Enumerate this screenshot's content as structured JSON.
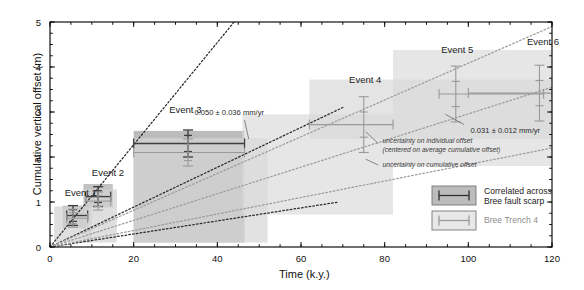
{
  "chart_data": {
    "type": "scatter",
    "title": "",
    "xlabel": "Time (k.y.)",
    "ylabel": "Cumulative vertical offset (m)",
    "xlim": [
      0,
      120
    ],
    "ylim": [
      0,
      5
    ],
    "xticks": [
      0,
      20,
      40,
      60,
      80,
      100,
      120
    ],
    "yticks": [
      0,
      1,
      2,
      3,
      4,
      5
    ],
    "xtick_labels": [
      "0",
      "20",
      "40",
      "60",
      "80",
      "100",
      "120"
    ],
    "ytick_labels": [
      "0",
      "1",
      "2",
      "3",
      "4",
      "5"
    ],
    "xminor_interval": 5,
    "yminor_interval": 0.25,
    "grid": false,
    "legend_position": "lower-right",
    "series": [
      {
        "name": "Correlated across Bree fault scarp",
        "color": "#3f3f3f",
        "points": [
          {
            "label": "Event 1",
            "x": 5.5,
            "y": 0.7,
            "xerr_low": 1.5,
            "xerr_high": 3.5,
            "yerr_cum": 0.22,
            "yerr_ind": 0.13
          },
          {
            "label": "Event 2",
            "x": 11.5,
            "y": 1.12,
            "xerr_low": 3.0,
            "xerr_high": 3.0,
            "yerr_cum": 0.22,
            "yerr_ind": 0.13
          },
          {
            "label": "Event 3",
            "x": 33.0,
            "y": 2.3,
            "xerr_low": 13.0,
            "xerr_high": 13.5,
            "yerr_cum": 0.3,
            "yerr_ind": 0.18
          }
        ]
      },
      {
        "name": "Bree Trench 4",
        "color": "#9a9a9a",
        "points": [
          {
            "label": "Event 1",
            "x": 5.5,
            "y": 0.64,
            "xerr_low": 1.5,
            "xerr_high": 3.5,
            "yerr_cum": 0.2,
            "yerr_ind": 0.12
          },
          {
            "label": "Event 2",
            "x": 11.5,
            "y": 1.02,
            "xerr_low": 3.0,
            "xerr_high": 3.0,
            "yerr_cum": 0.2,
            "yerr_ind": 0.12
          },
          {
            "label": "Event 3",
            "x": 33.0,
            "y": 2.1,
            "xerr_low": 13.0,
            "xerr_high": 13.5,
            "yerr_cum": 0.3,
            "yerr_ind": 0.18
          },
          {
            "label": "Event 4",
            "x": 75.0,
            "y": 2.72,
            "xerr_low": 13.0,
            "xerr_high": 7.0,
            "yerr_cum": 0.62,
            "yerr_ind": 0.28
          },
          {
            "label": "Event 5",
            "x": 97.0,
            "y": 3.4,
            "xerr_low": 4.0,
            "xerr_high": 21.0,
            "yerr_cum": 0.62,
            "yerr_ind": 0.28
          },
          {
            "label": "Event 6",
            "x": 117.0,
            "y": 3.42,
            "xerr_low": 17.0,
            "xerr_high": 3.0,
            "yerr_cum": 0.62,
            "yerr_ind": 0.28
          }
        ]
      }
    ],
    "shaded_boxes": [
      {
        "series": "Correlated across Bree fault scarp",
        "x0": 3.0,
        "x1": 9.0,
        "y0": 0.42,
        "y1": 0.92,
        "fill": "#a8a8a8"
      },
      {
        "series": "Correlated across Bree fault scarp",
        "x0": 8.0,
        "x1": 15.0,
        "y0": 0.88,
        "y1": 1.4,
        "fill": "#a8a8a8"
      },
      {
        "series": "Correlated across Bree fault scarp",
        "x0": 20.0,
        "x1": 46.5,
        "y0": 0.1,
        "y1": 2.58,
        "fill": "#a0a0a0"
      },
      {
        "series": "Bree Trench 4",
        "x0": 1.0,
        "x1": 10.0,
        "y0": 0.1,
        "y1": 0.9,
        "fill": "#d2d2d2"
      },
      {
        "series": "Bree Trench 4",
        "x0": 8.0,
        "x1": 16.0,
        "y0": 0.1,
        "y1": 1.28,
        "fill": "#d2d2d2"
      },
      {
        "series": "Bree Trench 4",
        "x0": 20.0,
        "x1": 52.0,
        "y0": 0.1,
        "y1": 2.42,
        "fill": "#d6d6d6"
      },
      {
        "series": "Bree Trench 4",
        "x0": 46.0,
        "x1": 82.0,
        "y0": 0.72,
        "y1": 2.95,
        "fill": "#dcdcdc"
      },
      {
        "series": "Bree Trench 4",
        "x0": 82.0,
        "x1": 120.0,
        "y0": 1.8,
        "y1": 4.38,
        "fill": "#dcdcdc"
      },
      {
        "series": "Bree Trench 4",
        "x0": 62.0,
        "x1": 120.0,
        "y0": 2.4,
        "y1": 3.72,
        "fill": "#d8d8d8"
      }
    ],
    "rate_lines": [
      {
        "label": "upper bound fault scarp",
        "x0": 0,
        "y0": 0,
        "x1": 44.0,
        "y1": 5.0,
        "color": "#2b2b2b",
        "style": "dotted"
      },
      {
        "label": "best fit fault scarp",
        "x0": 0,
        "y0": 0,
        "x1": 70.0,
        "y1": 3.1,
        "color": "#2b2b2b",
        "style": "dotted"
      },
      {
        "label": "lower bound fault scarp",
        "x0": 0,
        "y0": 0,
        "x1": 69.0,
        "y1": 1.0,
        "color": "#2b2b2b",
        "style": "dotted"
      },
      {
        "label": "upper bound trench",
        "x0": 0,
        "y0": 0,
        "x1": 120.0,
        "y1": 4.9,
        "color": "#9c9c9c",
        "style": "dotted"
      },
      {
        "label": "best fit trench",
        "x0": 0,
        "y0": 0,
        "x1": 120.0,
        "y1": 3.55,
        "color": "#9c9c9c",
        "style": "dotted"
      },
      {
        "label": "lower bound trench",
        "x0": 0,
        "y0": 0,
        "x1": 120.0,
        "y1": 2.2,
        "color": "#9c9c9c",
        "style": "dotted"
      }
    ],
    "annotations": [
      {
        "name": "rate-fault-scarp",
        "text": "0.050 ± 0.036 mm/yr",
        "x": 46.0,
        "y": 2.95
      },
      {
        "name": "rate-trench",
        "text": "0.031 ± 0.012 mm/yr",
        "x": 101.0,
        "y": 2.55
      },
      {
        "name": "uncertainty-individual",
        "text": "uncertainty on individual offset",
        "x": 79.0,
        "y": 2.28
      },
      {
        "name": "uncertainty-individual-sub",
        "text": "(centered on average cumulative offset)",
        "x": 79.0,
        "y": 2.14
      },
      {
        "name": "uncertainty-cumulative",
        "text": "uncertainty on cumulative offset",
        "x": 79.0,
        "y": 1.78
      }
    ],
    "event_labels": [
      {
        "name": "Event 1",
        "x": 3.5,
        "y": 1.33
      },
      {
        "name": "Event 2",
        "x": 10.0,
        "y": 1.78
      },
      {
        "name": "Event 3",
        "x": 28.5,
        "y": 3.17
      },
      {
        "name": "Event 4",
        "x": 71.5,
        "y": 3.85
      },
      {
        "name": "Event 5",
        "x": 93.5,
        "y": 4.52
      },
      {
        "name": "Event 6",
        "x": 114.0,
        "y": 4.7
      }
    ]
  },
  "axes": {
    "ylabel": "Cumulative vertical offset (m)",
    "xlabel": "Time (k.y.)",
    "xtick_labels": [
      "0",
      "20",
      "40",
      "60",
      "80",
      "100",
      "120"
    ],
    "ytick_labels": [
      "0",
      "1",
      "2",
      "3",
      "4",
      "5"
    ]
  },
  "legend": {
    "entries": [
      {
        "label_line1": "Correlated across",
        "label_line2": "Bree fault scarp",
        "swatch_fill": "#a6a6a6",
        "marker_color": "#2e2e2e"
      },
      {
        "label_line1": "Bree Trench 4",
        "label_line2": "",
        "swatch_fill": "#e0e0e0",
        "marker_color": "#9b9b9b"
      }
    ]
  },
  "annotations": {
    "rate_fault_scarp": "0.050 ± 0.036 mm/yr",
    "rate_trench": "0.031 ± 0.012 mm/yr",
    "unc_individual_1": "uncertainty on individual offset",
    "unc_individual_2": "(centered on average cumulative offset)",
    "unc_cumulative": "uncertainty on cumulative offset"
  },
  "event_labels": {
    "e1": "Event 1",
    "e2": "Event 2",
    "e3": "Event 3",
    "e4": "Event 4",
    "e5": "Event 5",
    "e6": "Event 6"
  },
  "colors": {
    "dark_series": "#3f3f3f",
    "light_series": "#9a9a9a",
    "axis": "#111111",
    "background": "#ffffff"
  }
}
